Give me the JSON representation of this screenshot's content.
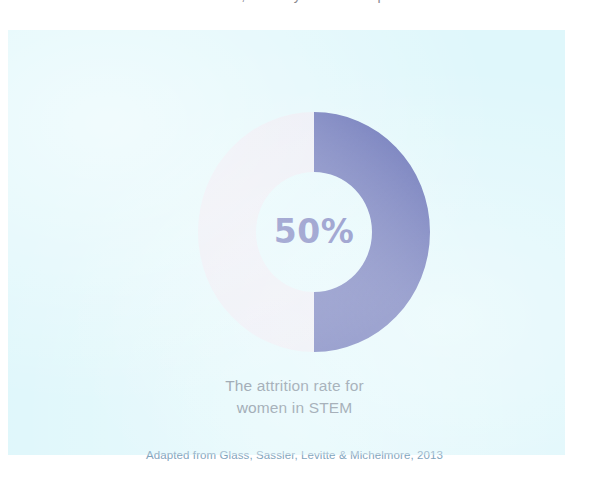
{
  "clipped_header": {
    "fragment_text": "discrimination, subtlety in the workplace"
  },
  "slide": {
    "background_color": "#dff7fb"
  },
  "chart_data": {
    "type": "pie",
    "variant": "donut",
    "title": "",
    "subtitle": "",
    "center_label": "50%",
    "categories": [
      "Attrition",
      "Remaining"
    ],
    "values": [
      50,
      50
    ],
    "value_unit": "%",
    "colors": [
      "#4f5bab",
      "#e8eaf3"
    ],
    "legend_position": "none",
    "grid": false,
    "start_angle_deg": 0,
    "inner_radius_ratio": 0.5,
    "annotations": [
      "The attrition rate for",
      "women in STEM"
    ]
  },
  "caption": {
    "line1": "The attrition rate for",
    "line2": "women in STEM"
  },
  "source": {
    "text": "Adapted from Glass, Sassler, Levitte & Michelmore, 2013"
  }
}
